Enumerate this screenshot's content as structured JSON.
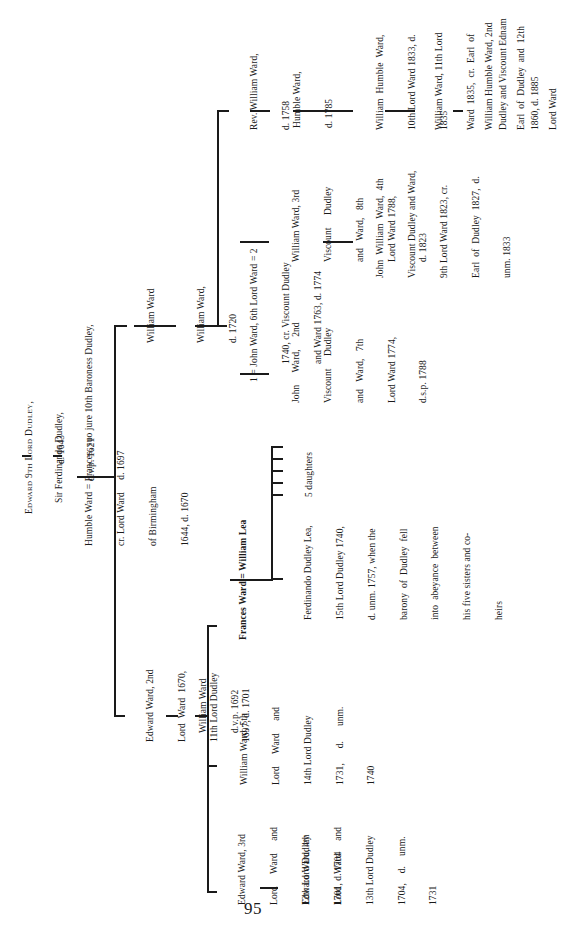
{
  "page": {
    "type": "scanned book page",
    "orientation": "rotated 90deg counter-clockwise",
    "page_number": "95"
  },
  "tree": {
    "nodes": {
      "edward_9th": {
        "lines": [
          "Edward 9th Lord Dudley,",
          "d. 1643"
        ]
      },
      "sir_ferdinando": {
        "lines": [
          "Sir Ferdinando Dudley,",
          "d.v.p. 1621"
        ]
      },
      "humble_frances": {
        "lines": [
          "Humble Ward = Frances, suo jure 10th Baroness Dudley,",
          "cr. Lord Ward     d. 1697",
          "of Birmingham",
          "1644, d. 1670"
        ]
      },
      "william_ward_a": {
        "lines": [
          "William Ward"
        ]
      },
      "william_ward_1720": {
        "lines": [
          "William Ward,",
          "d. 1720"
        ]
      },
      "john_ward_6th": {
        "lines": [
          "1 = John Ward, 6th Lord Ward = 2",
          "1740, cr. Viscount Dudley",
          "and Ward 1763, d. 1774"
        ]
      },
      "rev_william": {
        "lines": [
          "Rev. William Ward,",
          "d. 1758"
        ]
      },
      "humble_1785": {
        "lines": [
          "Humble Ward,",
          "d. 1785"
        ]
      },
      "william_humble_10th": {
        "lines": [
          "William  Humble  Ward,",
          "10th Lord Ward 1833, d.",
          "1835"
        ]
      },
      "william_11th": {
        "lines": [
          "William Ward, 11th Lord",
          "Ward  1835,  cr.  Earl  of",
          "Dudley and Viscount Ednam",
          "1860, d. 1885"
        ]
      },
      "william_humble_2nd_earl": {
        "lines": [
          "William Humble Ward, 2nd",
          "Earl  of  Dudley  and  12th",
          "Lord Ward"
        ]
      },
      "william_3rd_viscount": {
        "lines": [
          "William Ward, 3rd",
          "Viscount     Dudley",
          "and   Ward,   8th",
          "Lord Ward 1788,",
          "d. 1823"
        ]
      },
      "john_william_4th": {
        "lines": [
          "John  William  Ward,  4th",
          "Viscount Dudley and Ward,",
          "9th Lord Ward 1823, cr.",
          "Earl  of  Dudley  1827,  d.",
          "unm. 1833"
        ]
      },
      "john_2nd_viscount": {
        "lines": [
          "John     Ward,     2nd",
          "Viscount     Dudley",
          "and   Ward,   7th",
          "Lord Ward 1774,",
          "d.s.p. 1788"
        ]
      },
      "edward_2nd": {
        "lines": [
          "Edward Ward, 2nd",
          "Lord  Ward  1670,",
          "11th Lord Dudley",
          "1697, d. 1701"
        ]
      },
      "william_dvp_1692": {
        "lines": [
          "William Ward",
          "d.v.p. 1692"
        ]
      },
      "frances_william_lea": {
        "lines": [
          "Frances Ward = William Lea"
        ]
      },
      "ferdinando_lea": {
        "lines": [
          "Ferdinando Dudley Lea,",
          "15th Lord Dudley 1740,",
          "d. unm. 1757, when the",
          "barony  of  Dudley  fell",
          "into  abeyance  between",
          "his five sisters and co-",
          "heirs"
        ]
      },
      "five_daughters": {
        "lines": [
          "5 daughters"
        ]
      },
      "william_5th": {
        "lines": [
          "William Ward, 5th",
          "Lord     Ward     and",
          "14th Lord Dudley",
          "1731,      d.      unm.",
          "1740"
        ]
      },
      "edward_3rd": {
        "lines": [
          "Edward Ward, 3rd",
          "Lord     Ward     and",
          "12th Lord Dudley",
          "1701, d. 1704"
        ]
      },
      "edward_4th": {
        "lines": [
          "Edward Ward, 4th",
          "Lord     Ward     and",
          "13th Lord Dudley",
          "1704,    d.    unm.",
          "1731"
        ]
      }
    }
  }
}
